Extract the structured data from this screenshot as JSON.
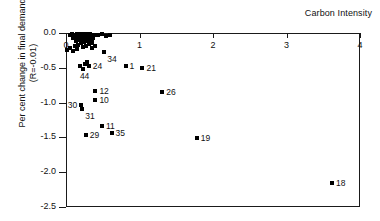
{
  "chart_data": {
    "type": "scatter",
    "title": "Carbon Intensity",
    "xlabel": "Carbon Intensity",
    "ylabel": "Per cent change in final demand",
    "ylabel_line2": "(R=-0.01)",
    "xlim": [
      0,
      4
    ],
    "ylim": [
      -2.5,
      0.0
    ],
    "xticks": [
      0,
      1,
      2,
      3,
      4
    ],
    "xtick_labels": [
      "0",
      "1",
      "2",
      "3",
      "4"
    ],
    "yticks": [
      0.0,
      -0.5,
      -1.0,
      -1.5,
      -2.0,
      -2.5
    ],
    "ytick_labels": [
      "0.0",
      "-0.5",
      "-1.0",
      "-1.5",
      "-2.0",
      "-2.5"
    ],
    "grid": false,
    "legend": false,
    "marker": "square",
    "marker_color": "#000000",
    "xaxis_position": "top",
    "points": [
      {
        "label": "18",
        "x": 3.62,
        "y": -2.15,
        "label_pos": "right"
      },
      {
        "label": "19",
        "x": 1.78,
        "y": -1.51,
        "label_pos": "right"
      },
      {
        "label": "35",
        "x": 0.62,
        "y": -1.43,
        "label_pos": "right"
      },
      {
        "label": "29",
        "x": 0.27,
        "y": -1.47,
        "label_pos": "right"
      },
      {
        "label": "11",
        "x": 0.49,
        "y": -1.33,
        "label_pos": "right"
      },
      {
        "label": "31",
        "x": 0.22,
        "y": -1.09,
        "label_pos": "below-right"
      },
      {
        "label": "30",
        "x": 0.2,
        "y": -1.04,
        "label_pos": "left"
      },
      {
        "label": "10",
        "x": 0.4,
        "y": -0.96,
        "label_pos": "right"
      },
      {
        "label": "26",
        "x": 1.31,
        "y": -0.85,
        "label_pos": "right"
      },
      {
        "label": "12",
        "x": 0.4,
        "y": -0.83,
        "label_pos": "right"
      },
      {
        "label": "44",
        "x": 0.23,
        "y": -0.52,
        "label_pos": "below"
      },
      {
        "label": "24",
        "x": 0.31,
        "y": -0.48,
        "label_pos": "right"
      },
      {
        "label": "21",
        "x": 1.04,
        "y": -0.51,
        "label_pos": "right"
      },
      {
        "label": "1",
        "x": 0.81,
        "y": -0.47,
        "label_pos": "right"
      },
      {
        "label": "34",
        "x": 0.52,
        "y": -0.27,
        "label_pos": "below-right"
      },
      {
        "label": "",
        "x": 0.19,
        "y": -0.47,
        "label_pos": "none"
      },
      {
        "label": "",
        "x": 0.26,
        "y": -0.45,
        "label_pos": "none"
      },
      {
        "label": "",
        "x": 0.29,
        "y": -0.42,
        "label_pos": "none"
      },
      {
        "label": "",
        "x": 0.06,
        "y": -0.21,
        "label_pos": "none"
      },
      {
        "label": "",
        "x": 0.12,
        "y": -0.19,
        "label_pos": "none"
      },
      {
        "label": "",
        "x": 0.17,
        "y": -0.17,
        "label_pos": "none"
      },
      {
        "label": "",
        "x": 0.23,
        "y": -0.2,
        "label_pos": "none"
      },
      {
        "label": "",
        "x": 0.27,
        "y": -0.18,
        "label_pos": "none"
      },
      {
        "label": "",
        "x": 0.31,
        "y": -0.16,
        "label_pos": "none"
      },
      {
        "label": "",
        "x": 0.2,
        "y": -0.14,
        "label_pos": "none"
      },
      {
        "label": "",
        "x": 0.25,
        "y": -0.13,
        "label_pos": "none"
      },
      {
        "label": "",
        "x": 0.3,
        "y": -0.12,
        "label_pos": "none"
      },
      {
        "label": "",
        "x": 0.34,
        "y": -0.15,
        "label_pos": "none"
      },
      {
        "label": "",
        "x": 0.36,
        "y": -0.13,
        "label_pos": "none"
      },
      {
        "label": "",
        "x": 0.14,
        "y": -0.11,
        "label_pos": "none"
      },
      {
        "label": "",
        "x": 0.18,
        "y": -0.1,
        "label_pos": "none"
      },
      {
        "label": "",
        "x": 0.22,
        "y": -0.1,
        "label_pos": "none"
      },
      {
        "label": "",
        "x": 0.26,
        "y": -0.09,
        "label_pos": "none"
      },
      {
        "label": "",
        "x": 0.3,
        "y": -0.08,
        "label_pos": "none"
      },
      {
        "label": "",
        "x": 0.33,
        "y": -0.09,
        "label_pos": "none"
      },
      {
        "label": "",
        "x": 0.37,
        "y": -0.07,
        "label_pos": "none"
      },
      {
        "label": "",
        "x": 0.1,
        "y": -0.07,
        "label_pos": "none"
      },
      {
        "label": "",
        "x": 0.13,
        "y": -0.06,
        "label_pos": "none"
      },
      {
        "label": "",
        "x": 0.16,
        "y": -0.05,
        "label_pos": "none"
      },
      {
        "label": "",
        "x": 0.19,
        "y": -0.05,
        "label_pos": "none"
      },
      {
        "label": "",
        "x": 0.22,
        "y": -0.04,
        "label_pos": "none"
      },
      {
        "label": "",
        "x": 0.25,
        "y": -0.05,
        "label_pos": "none"
      },
      {
        "label": "",
        "x": 0.28,
        "y": -0.04,
        "label_pos": "none"
      },
      {
        "label": "",
        "x": 0.31,
        "y": -0.03,
        "label_pos": "none"
      },
      {
        "label": "",
        "x": 0.35,
        "y": -0.04,
        "label_pos": "none"
      },
      {
        "label": "",
        "x": 0.05,
        "y": -0.03,
        "label_pos": "none"
      },
      {
        "label": "",
        "x": 0.08,
        "y": -0.02,
        "label_pos": "none"
      },
      {
        "label": "",
        "x": 0.12,
        "y": -0.03,
        "label_pos": "none"
      },
      {
        "label": "",
        "x": 0.15,
        "y": -0.02,
        "label_pos": "none"
      },
      {
        "label": "",
        "x": 0.2,
        "y": -0.02,
        "label_pos": "none"
      },
      {
        "label": "",
        "x": 0.24,
        "y": -0.02,
        "label_pos": "none"
      },
      {
        "label": "",
        "x": 0.28,
        "y": -0.02,
        "label_pos": "none"
      },
      {
        "label": "",
        "x": 0.33,
        "y": -0.02,
        "label_pos": "none"
      },
      {
        "label": "",
        "x": 0.38,
        "y": -0.03,
        "label_pos": "none"
      },
      {
        "label": "",
        "x": 0.44,
        "y": -0.03,
        "label_pos": "none"
      },
      {
        "label": "",
        "x": 0.49,
        "y": -0.02,
        "label_pos": "none"
      },
      {
        "label": "",
        "x": 0.55,
        "y": -0.04,
        "label_pos": "none"
      },
      {
        "label": "",
        "x": 0.6,
        "y": -0.03,
        "label_pos": "none"
      },
      {
        "label": "",
        "x": 0.02,
        "y": -0.24,
        "label_pos": "none"
      },
      {
        "label": "",
        "x": 0.09,
        "y": -0.26,
        "label_pos": "none"
      },
      {
        "label": "",
        "x": 0.15,
        "y": -0.23,
        "label_pos": "none"
      },
      {
        "label": "",
        "x": 0.36,
        "y": -0.22,
        "label_pos": "none"
      },
      {
        "label": "",
        "x": 0.39,
        "y": -0.19,
        "label_pos": "none"
      }
    ]
  }
}
